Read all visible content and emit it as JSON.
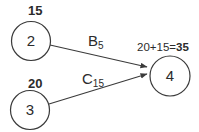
{
  "diagram": {
    "background_color": "#ffffff",
    "line_color": "#3a3a3a",
    "text_color": "#2b2b2b",
    "nodes": {
      "n2": {
        "value": "2",
        "cost": "15"
      },
      "n3": {
        "value": "3",
        "cost": "20"
      },
      "n4": {
        "value": "4",
        "cost_expression": "20+15=",
        "cost_total": "35"
      }
    },
    "edges": {
      "b": {
        "name": "B",
        "subscript": "5"
      },
      "c": {
        "name": "C",
        "subscript": "15"
      }
    }
  }
}
